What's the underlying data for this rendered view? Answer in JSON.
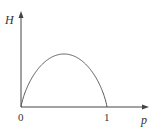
{
  "chart_data": {
    "type": "line",
    "title": "",
    "xlabel": "p",
    "ylabel": "H",
    "x_ticks": [
      "0",
      "1"
    ],
    "xlim": [
      0,
      1
    ],
    "ylim": [
      0,
      1
    ],
    "grid": false,
    "legend": null,
    "series": [
      {
        "name": "H(p)",
        "x": [
          0,
          0.05,
          0.1,
          0.2,
          0.3,
          0.4,
          0.5,
          0.6,
          0.7,
          0.8,
          0.9,
          0.95,
          1
        ],
        "y": [
          0,
          0.286,
          0.469,
          0.722,
          0.881,
          0.971,
          1.0,
          0.971,
          0.881,
          0.722,
          0.469,
          0.286,
          0
        ]
      }
    ]
  },
  "axes": {
    "y_label": "H",
    "x_label": "p",
    "origin_label": "0",
    "x_tick_one": "1"
  },
  "colors": {
    "line": "#555555",
    "axis": "#444444"
  }
}
